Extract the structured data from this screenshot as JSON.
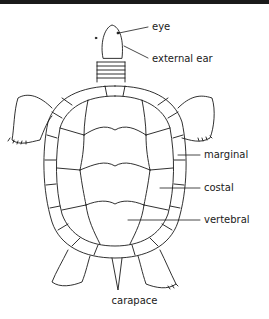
{
  "figure": {
    "caption": "carapace",
    "labels": {
      "eye": "eye",
      "external_ear": "external ear",
      "marginal": "marginal",
      "costal": "costal",
      "vertebral": "vertebral"
    }
  }
}
